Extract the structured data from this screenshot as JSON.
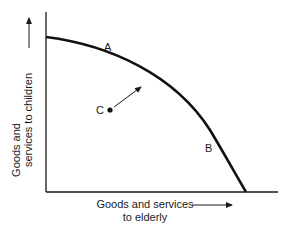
{
  "diagram": {
    "type": "production-possibilities-frontier",
    "y_axis_label_line1": "Goods and",
    "y_axis_label_line2": "services to children",
    "x_axis_label_line1": "Goods and services",
    "x_axis_label_line2": "to elderly",
    "points": {
      "A": "A",
      "B": "B",
      "C": "C"
    },
    "colors": {
      "ink": "#1a1a1a",
      "background": "#ffffff"
    }
  }
}
